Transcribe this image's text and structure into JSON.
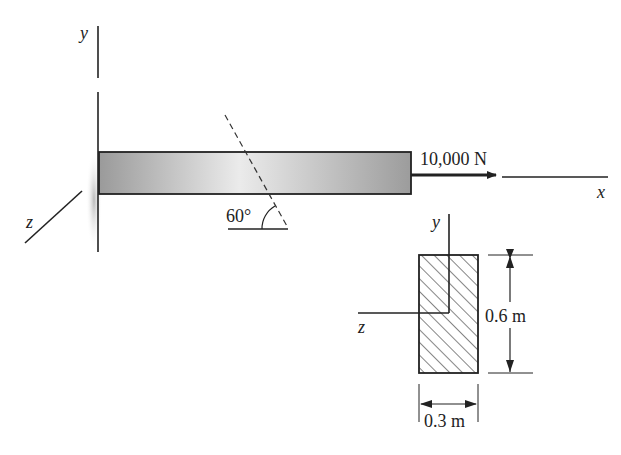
{
  "diagram": {
    "type": "cantilever beam with axial load and cross-section",
    "beam": {
      "axes": {
        "x": "x",
        "y": "y",
        "z": "z"
      },
      "load": {
        "label": "10,000 N",
        "direction": "+x"
      },
      "section_angle": {
        "label": "60°"
      }
    },
    "cross_section": {
      "axes": {
        "y": "y",
        "z": "z"
      },
      "height_label": "0.6 m",
      "width_label": "0.3 m",
      "fill": "hatched"
    },
    "colors": {
      "line": "#222222",
      "beam_fill_dark": "#8a8a8a",
      "beam_fill_light": "#e8e8e8"
    }
  }
}
